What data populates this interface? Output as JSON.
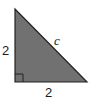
{
  "diagram": {
    "type": "right-triangle",
    "fill_color": "#717171",
    "stroke_color": "#222222",
    "vertices": [
      [
        15,
        9
      ],
      [
        15,
        82
      ],
      [
        87,
        82
      ]
    ],
    "right_angle_at": "bottom-left",
    "labels": {
      "left_leg": "2",
      "bottom_leg": "2",
      "hypotenuse": "c"
    }
  }
}
